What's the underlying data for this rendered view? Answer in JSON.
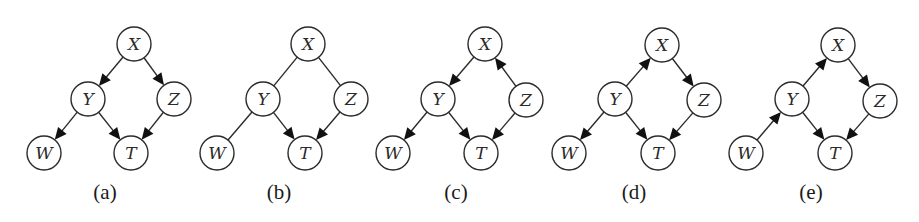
{
  "figure": {
    "width": 919,
    "height": 222,
    "node_radius": 17,
    "colors": {
      "stroke": "#2b2b2b",
      "arrow": "#111111",
      "background": "#ffffff"
    }
  },
  "panels": [
    {
      "id": "a",
      "caption": "(a)",
      "caption_pos": [
        105,
        199
      ],
      "nodes": [
        {
          "id": "X",
          "label": "X",
          "x": 134,
          "y": 44
        },
        {
          "id": "Y",
          "label": "Y",
          "x": 88,
          "y": 99
        },
        {
          "id": "Z",
          "label": "Z",
          "x": 174,
          "y": 99
        },
        {
          "id": "W",
          "label": "W",
          "x": 44,
          "y": 153
        },
        {
          "id": "T",
          "label": "T",
          "x": 131,
          "y": 153
        }
      ],
      "edges": [
        {
          "from": "X",
          "to": "Y",
          "directed": true
        },
        {
          "from": "X",
          "to": "Z",
          "directed": true
        },
        {
          "from": "Y",
          "to": "W",
          "directed": true
        },
        {
          "from": "Y",
          "to": "T",
          "directed": true
        },
        {
          "from": "Z",
          "to": "T",
          "directed": true
        }
      ]
    },
    {
      "id": "b",
      "caption": "(b)",
      "caption_pos": [
        279,
        199
      ],
      "nodes": [
        {
          "id": "X",
          "label": "X",
          "x": 308,
          "y": 44
        },
        {
          "id": "Y",
          "label": "Y",
          "x": 263,
          "y": 99
        },
        {
          "id": "Z",
          "label": "Z",
          "x": 351,
          "y": 99
        },
        {
          "id": "W",
          "label": "W",
          "x": 217,
          "y": 153
        },
        {
          "id": "T",
          "label": "T",
          "x": 305,
          "y": 153
        }
      ],
      "edges": [
        {
          "from": "X",
          "to": "Y",
          "directed": false
        },
        {
          "from": "X",
          "to": "Z",
          "directed": false
        },
        {
          "from": "Y",
          "to": "W",
          "directed": false
        },
        {
          "from": "Y",
          "to": "T",
          "directed": true
        },
        {
          "from": "Z",
          "to": "T",
          "directed": true
        }
      ]
    },
    {
      "id": "c",
      "caption": "(c)",
      "caption_pos": [
        456,
        199
      ],
      "nodes": [
        {
          "id": "X",
          "label": "X",
          "x": 485,
          "y": 44
        },
        {
          "id": "Y",
          "label": "Y",
          "x": 438,
          "y": 99
        },
        {
          "id": "Z",
          "label": "Z",
          "x": 526,
          "y": 100
        },
        {
          "id": "W",
          "label": "W",
          "x": 393,
          "y": 153
        },
        {
          "id": "T",
          "label": "T",
          "x": 481,
          "y": 153
        }
      ],
      "edges": [
        {
          "from": "X",
          "to": "Y",
          "directed": true
        },
        {
          "from": "Z",
          "to": "X",
          "directed": true
        },
        {
          "from": "Y",
          "to": "W",
          "directed": true
        },
        {
          "from": "Y",
          "to": "T",
          "directed": true
        },
        {
          "from": "Z",
          "to": "T",
          "directed": true
        }
      ]
    },
    {
      "id": "d",
      "caption": "(d)",
      "caption_pos": [
        634,
        199
      ],
      "nodes": [
        {
          "id": "X",
          "label": "X",
          "x": 662,
          "y": 45
        },
        {
          "id": "Y",
          "label": "Y",
          "x": 615,
          "y": 99
        },
        {
          "id": "Z",
          "label": "Z",
          "x": 704,
          "y": 100
        },
        {
          "id": "W",
          "label": "W",
          "x": 569,
          "y": 153
        },
        {
          "id": "T",
          "label": "T",
          "x": 658,
          "y": 153
        }
      ],
      "edges": [
        {
          "from": "Y",
          "to": "X",
          "directed": true
        },
        {
          "from": "X",
          "to": "Z",
          "directed": true
        },
        {
          "from": "Y",
          "to": "W",
          "directed": true
        },
        {
          "from": "Y",
          "to": "T",
          "directed": true
        },
        {
          "from": "Z",
          "to": "T",
          "directed": true
        }
      ]
    },
    {
      "id": "e",
      "caption": "(e)",
      "caption_pos": [
        811,
        199
      ],
      "nodes": [
        {
          "id": "X",
          "label": "X",
          "x": 838,
          "y": 45
        },
        {
          "id": "Y",
          "label": "Y",
          "x": 792,
          "y": 99
        },
        {
          "id": "Z",
          "label": "Z",
          "x": 880,
          "y": 101
        },
        {
          "id": "W",
          "label": "W",
          "x": 746,
          "y": 153
        },
        {
          "id": "T",
          "label": "T",
          "x": 835,
          "y": 153
        }
      ],
      "edges": [
        {
          "from": "Y",
          "to": "X",
          "directed": true
        },
        {
          "from": "X",
          "to": "Z",
          "directed": true
        },
        {
          "from": "W",
          "to": "Y",
          "directed": true
        },
        {
          "from": "Y",
          "to": "T",
          "directed": true
        },
        {
          "from": "Z",
          "to": "T",
          "directed": true
        }
      ]
    }
  ]
}
